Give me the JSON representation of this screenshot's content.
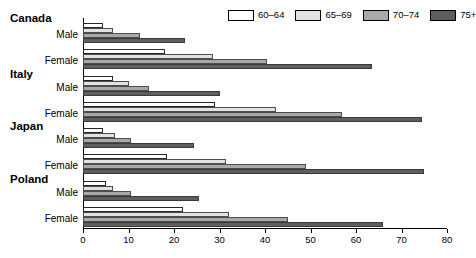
{
  "chart_data": {
    "type": "bar",
    "orientation": "horizontal",
    "title": "",
    "xlabel": "",
    "ylabel": "",
    "xlim": [
      0,
      80
    ],
    "xticks": [
      0,
      10,
      20,
      30,
      40,
      50,
      60,
      70,
      80
    ],
    "xtick_labels": [
      "0",
      "10",
      "20",
      "30",
      "40",
      "50",
      "60",
      "70",
      "80"
    ],
    "grid": false,
    "legend_position": "top-right",
    "legend": [
      {
        "label": "60–64",
        "color": "#ffffff"
      },
      {
        "label": "65–69",
        "color": "#e2e2e2"
      },
      {
        "label": "70–74",
        "color": "#a8a8a8"
      },
      {
        "label": "75+",
        "color": "#5e5e5e"
      }
    ],
    "series": [
      {
        "name": "60–64",
        "color": "#ffffff"
      },
      {
        "name": "65–69",
        "color": "#e2e2e2"
      },
      {
        "name": "70–74",
        "color": "#a8a8a8"
      },
      {
        "name": "75+",
        "color": "#5e5e5e"
      }
    ],
    "groups": [
      {
        "country": "Canada",
        "rows": [
          {
            "gender": "Male",
            "values": [
              4.5,
              6.5,
              12.5,
              22.5
            ]
          },
          {
            "gender": "Female",
            "values": [
              18.0,
              28.5,
              40.5,
              63.5
            ]
          }
        ]
      },
      {
        "country": "Italy",
        "rows": [
          {
            "gender": "Male",
            "values": [
              6.5,
              10.0,
              14.5,
              30.0
            ]
          },
          {
            "gender": "Female",
            "values": [
              29.0,
              42.5,
              57.0,
              74.5
            ]
          }
        ]
      },
      {
        "country": "Japan",
        "rows": [
          {
            "gender": "Male",
            "values": [
              4.5,
              7.0,
              10.5,
              24.5
            ]
          },
          {
            "gender": "Female",
            "values": [
              18.5,
              31.5,
              49.0,
              75.0
            ]
          }
        ]
      },
      {
        "country": "Poland",
        "rows": [
          {
            "gender": "Male",
            "values": [
              5.0,
              6.5,
              10.5,
              25.5
            ]
          },
          {
            "gender": "Female",
            "values": [
              22.0,
              32.0,
              45.0,
              66.0
            ]
          }
        ]
      }
    ]
  }
}
